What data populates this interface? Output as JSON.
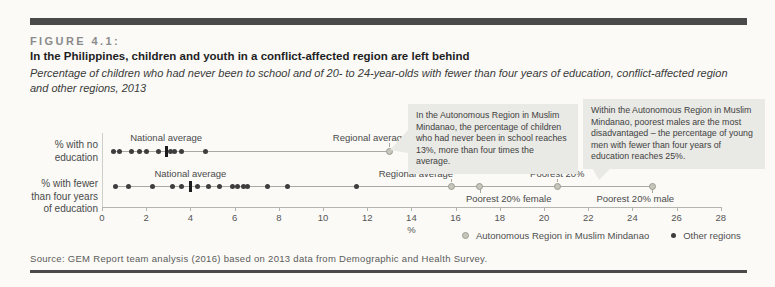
{
  "header": {
    "figure_label": "FIGURE 4.1:",
    "title": "In the Philippines, children and youth in a conflict-affected region are left behind",
    "subtitle": "Percentage of children who had never been to school and of 20- to 24-year-olds with fewer than four years of education, conflict-affected region and other regions, 2013"
  },
  "annotations": [
    {
      "text": "In the Autonomous Region in Muslim Mindanao, the percentage of children who had never been in school reaches 13%, more than four times the average."
    },
    {
      "text": "Within the Autonomous Region in Muslim Mindanao, poorest males are the most disadvantaged – the percentage of young men with fewer than four years of education reaches 25%."
    }
  ],
  "chart_data": {
    "type": "scatter",
    "xlabel": "%",
    "xlim": [
      0,
      28
    ],
    "x_ticks": [
      0,
      2,
      4,
      6,
      8,
      10,
      12,
      14,
      16,
      18,
      20,
      22,
      24,
      26,
      28
    ],
    "grid": false,
    "rows": [
      {
        "label": "% with no education",
        "other_regions_values": [
          0.5,
          0.8,
          1.35,
          1.7,
          2.0,
          2.55,
          3.1,
          3.3,
          3.6,
          4.7
        ],
        "national_average": {
          "label": "National average",
          "value": 2.9
        },
        "armm_markers": [
          {
            "label": "Regional average",
            "value": 13,
            "label_pos": "above",
            "anchor": "right",
            "dx": 18
          }
        ]
      },
      {
        "label": "% with fewer than four years of education",
        "other_regions_values": [
          0.6,
          1.2,
          2.3,
          3.2,
          3.6,
          4.3,
          4.8,
          5.3,
          5.9,
          6.15,
          6.4,
          6.6,
          7.5,
          8.4,
          11.5
        ],
        "national_average": {
          "label": "National average",
          "value": 4.0
        },
        "armm_markers": [
          {
            "label": "Regional average",
            "value": 15.8,
            "label_pos": "above",
            "anchor": "right",
            "dx": 2
          },
          {
            "label": "Poorest 20% female",
            "value": 17.1,
            "label_pos": "below",
            "anchor": "left",
            "dx": -14
          },
          {
            "label": "Poorest 20%",
            "value": 20.6,
            "label_pos": "above",
            "anchor": "center",
            "dx": 0
          },
          {
            "label": "Poorest 20% male",
            "value": 24.9,
            "label_pos": "below",
            "anchor": "center",
            "dx": -17
          }
        ]
      }
    ],
    "legend": [
      {
        "label": "Autonomous Region in Muslim Mindanao",
        "marker": "armm"
      },
      {
        "label": "Other regions",
        "marker": "other"
      }
    ],
    "legend_position": "bottom-right"
  },
  "source": "Source: GEM Report team analysis (2016) based on 2013 data from Demographic and Health Survey.",
  "colors": {
    "frame_bar": "#4a4a4a",
    "other_regions_dot": "#3d3d3d",
    "armm_marker": "#c6c6bc",
    "armm_marker_border": "#9c9c90",
    "national_average_tick": "#1c1c1c",
    "connector_line": "#a9a9a1",
    "axis": "#b5b5b0",
    "annotation_bg": "#e9e9e5"
  }
}
